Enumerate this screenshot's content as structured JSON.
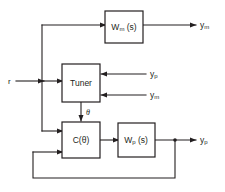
{
  "diagram": {
    "type": "block-diagram",
    "background_color": "#ffffff",
    "line_color": "#231f20",
    "blocks": [
      {
        "id": "wm",
        "label": "W",
        "subscript": "m",
        "suffix": " (s)",
        "x": 105,
        "y": 11,
        "w": 38,
        "h": 32
      },
      {
        "id": "tuner",
        "label": "Tuner",
        "subscript": "",
        "suffix": "",
        "x": 62,
        "y": 64,
        "w": 38,
        "h": 38
      },
      {
        "id": "ctheta",
        "label": "C(",
        "subscript": "",
        "suffix": "θ)",
        "x": 62,
        "y": 122,
        "w": 38,
        "h": 36
      },
      {
        "id": "wp",
        "label": "W",
        "subscript": "p",
        "suffix": " (s)",
        "x": 118,
        "y": 123,
        "w": 37,
        "h": 34
      }
    ],
    "signals": [
      {
        "id": "r",
        "text": "r",
        "sub": "",
        "x": 8,
        "y": 81
      },
      {
        "id": "ym_out",
        "text": "y",
        "sub": "m",
        "x": 200,
        "y": 25
      },
      {
        "id": "yp_in",
        "text": "y",
        "sub": "p",
        "x": 150,
        "y": 74
      },
      {
        "id": "ym_in",
        "text": "y",
        "sub": "m",
        "x": 150,
        "y": 95
      },
      {
        "id": "theta",
        "text": "θ",
        "sub": "",
        "x": 86,
        "y": 112
      },
      {
        "id": "yp_out",
        "text": "y",
        "sub": "p",
        "x": 200,
        "y": 140
      }
    ],
    "junctions": [
      {
        "id": "output-tap",
        "x": 175,
        "y": 140
      }
    ]
  }
}
